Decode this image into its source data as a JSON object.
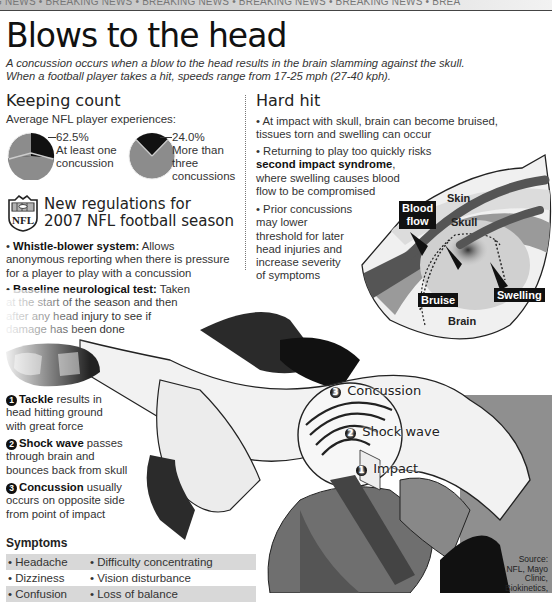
{
  "banner": {
    "text": "G NEWS • BREAKING NEWS • BREAKING NEWS • BREAKING NEWS • BREAKING NEWS • BREA"
  },
  "header": {
    "title": "Blows to the head",
    "deck_line1": "A concussion occurs when a blow to the head results in the brain slamming against the skull.",
    "deck_line2": "When a football player takes a hit, speeds range from 17-25 mph (27-40 kph)."
  },
  "keeping_count": {
    "heading": "Keeping count",
    "subheading": "Average NFL player experiences:",
    "pies": [
      {
        "value": "62.5%",
        "label_line1": "At least one",
        "label_line2": "concussion",
        "label_line3": ""
      },
      {
        "value": "24.0%",
        "label_line1": "More than",
        "label_line2": "three",
        "label_line3": "concussions"
      }
    ]
  },
  "regulations": {
    "logo_text": "NFL",
    "heading_line1": "New regulations for",
    "heading_line2": "2007 NFL football season",
    "items": [
      {
        "bold": "Whistle-blower system:",
        "text_l1": " Allows",
        "text_l2": "anonymous reporting when there is pressure",
        "text_l3": "for a player to play with a concussion"
      },
      {
        "bold": "Baseline neurological test:",
        "text_l1": " Taken",
        "text_l2": "at the start of the season and then",
        "text_l3": "after any head injury to see if",
        "text_l4": "damage has been done"
      }
    ]
  },
  "hard_hit": {
    "heading": "Hard hit",
    "bullet1_l1": "• At impact with skull, brain can become bruised,",
    "bullet1_l2": "tissues torn and swelling can occur",
    "bullet2_l1": "• Returning to play too quickly risks",
    "bullet2_bold": "second impact syndrome",
    "bullet2_l2_tail": ",",
    "bullet2_l3": "where swelling causes blood",
    "bullet2_l4": "flow to be compromised",
    "bullet3": [
      "• Prior concussions",
      "may lower",
      "threshold for later",
      "head injuries and",
      "increase severity",
      "of symptoms"
    ]
  },
  "brain_diagram": {
    "labels": {
      "blood_flow_l1": "Blood",
      "blood_flow_l2": "flow",
      "skin": "Skin",
      "skull": "Skull",
      "bruise": "Bruise",
      "swelling": "Swelling",
      "brain": "Brain"
    }
  },
  "steps": [
    {
      "num": "1",
      "bold": "Tackle",
      "l1": " results in",
      "l2": "head hitting ground",
      "l3": "with great force"
    },
    {
      "num": "2",
      "bold": "Shock wave",
      "l1": " passes",
      "l2": "through brain and",
      "l3": "bounces back from skull"
    },
    {
      "num": "3",
      "bold": "Concussion",
      "l1": " usually",
      "l2": "occurs on opposite side",
      "l3": "from point of impact"
    }
  ],
  "helmet_callouts": [
    {
      "num": "3",
      "label": "Concussion"
    },
    {
      "num": "2",
      "label": "Shock wave"
    },
    {
      "num": "1",
      "label": "Impact"
    }
  ],
  "symptoms": {
    "heading": "Symptoms",
    "rows": [
      {
        "c1": "• Headache",
        "c2": "• Difficulty concentrating"
      },
      {
        "c1": "• Dizziness",
        "c2": "• Vision disturbance"
      },
      {
        "c1": "• Confusion",
        "c2": "• Loss of balance"
      }
    ]
  },
  "source": {
    "l1": "Source:",
    "l2": "NFL, Mayo",
    "l3": "Clinic,",
    "l4": "Biokinetics,"
  },
  "colors": {
    "dark": "#111111",
    "mid_gray": "#8c8c8c",
    "light_gray": "#d8d8d8"
  }
}
